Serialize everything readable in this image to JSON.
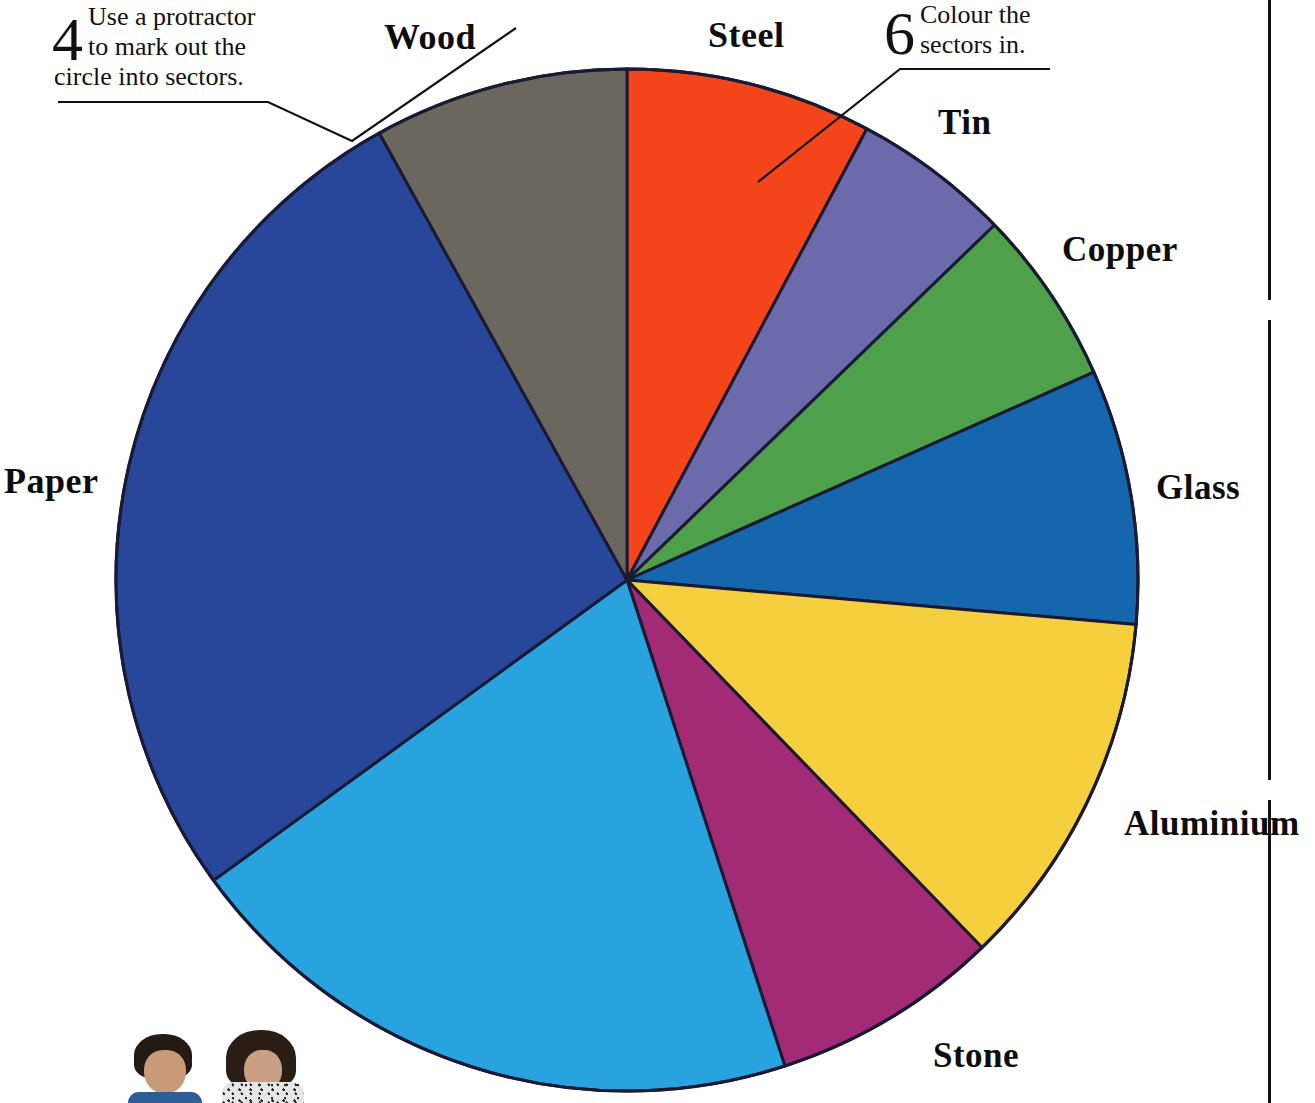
{
  "annotations": [
    {
      "number": "4",
      "line1": "Use a protractor",
      "line2": "to mark out the",
      "line3": "circle into sectors.",
      "name": "annotation-step-4"
    },
    {
      "number": "6",
      "line1": "Colour the",
      "line2": "sectors in.",
      "line3": "",
      "name": "annotation-step-6"
    }
  ],
  "chart_data": {
    "type": "pie",
    "title": "",
    "legend_position": "outside-labels",
    "center": {
      "x": 627,
      "y": 580
    },
    "radius": 511,
    "start_angle_deg": 0,
    "direction": "clockwise",
    "stroke": "#1a1a33",
    "categories": [
      "Steel",
      "Tin",
      "Copper",
      "Glass",
      "Aluminium",
      "Stone",
      "Paper",
      "Wood"
    ],
    "values": [
      28,
      18,
      20,
      29,
      41,
      26,
      163,
      35
    ],
    "slices": [
      {
        "label": "Steel",
        "start_deg": 0,
        "end_deg": 28,
        "angle_deg": 28,
        "color": "#f4441a",
        "label_x": 708,
        "label_y": 14
      },
      {
        "label": "Tin",
        "start_deg": 28,
        "end_deg": 46,
        "angle_deg": 18,
        "color": "#6b6bac",
        "label_x": 938,
        "label_y": 103
      },
      {
        "label": "Copper",
        "start_deg": 46,
        "end_deg": 66,
        "angle_deg": 20,
        "color": "#4fa04a",
        "label_x": 1062,
        "label_y": 230
      },
      {
        "label": "Glass",
        "start_deg": 66,
        "end_deg": 95,
        "angle_deg": 29,
        "color": "#1566ad",
        "label_x": 1156,
        "label_y": 468
      },
      {
        "label": "Aluminium",
        "start_deg": 95,
        "end_deg": 136,
        "angle_deg": 41,
        "color": "#f6cf3f",
        "label_x": 1124,
        "label_y": 804
      },
      {
        "label": "Stone",
        "start_deg": 136,
        "end_deg": 162,
        "angle_deg": 26,
        "color": "#a32a74",
        "label_x": 933,
        "label_y": 1036
      },
      {
        "label": "Paper-light",
        "start_deg": 162,
        "end_deg": 234,
        "angle_deg": 72,
        "color": "#29a3e0",
        "label_x": null,
        "label_y": null
      },
      {
        "label": "Paper",
        "start_deg": 234,
        "end_deg": 331,
        "angle_deg": 97,
        "color": "#28469a",
        "label_x": 4,
        "label_y": 460
      },
      {
        "label": "Wood",
        "start_deg": 331,
        "end_deg": 360,
        "angle_deg": 29,
        "color": "#6b665e",
        "label_x": 384,
        "label_y": 16
      }
    ]
  },
  "labels": {
    "wood": "Wood",
    "steel": "Steel",
    "tin": "Tin",
    "copper": "Copper",
    "glass": "Glass",
    "aluminium": "Aluminium",
    "stone": "Stone",
    "paper": "Paper"
  },
  "colors": {
    "steel": "#f4441a",
    "tin": "#6b6bac",
    "copper": "#4fa04a",
    "glass": "#1566ad",
    "aluminium": "#f6cf3f",
    "stone": "#a32a74",
    "paper_light": "#29a3e0",
    "paper": "#28469a",
    "wood": "#6b665e",
    "outline": "#1a1a33",
    "text": "#0d0d0d",
    "background": "#ffffff"
  }
}
